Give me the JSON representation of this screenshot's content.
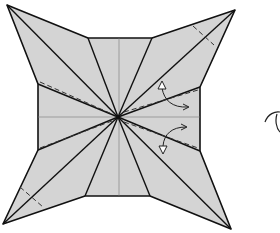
{
  "diagram": {
    "type": "origami-crease-pattern-step",
    "colors": {
      "paper": "#d4d4d4",
      "line": "#111111",
      "background": "#ffffff"
    },
    "center": [
      118,
      117
    ],
    "outline": [
      [
        7,
        5
      ],
      [
        88,
        38
      ],
      [
        152,
        38
      ],
      [
        235,
        10
      ],
      [
        200,
        87
      ],
      [
        200,
        151
      ],
      [
        231,
        229
      ],
      [
        150,
        196
      ],
      [
        85,
        196
      ],
      [
        3,
        224
      ],
      [
        38,
        150
      ],
      [
        38,
        84
      ]
    ],
    "tips": {
      "top_left": [
        7,
        5
      ],
      "top_right": [
        235,
        10
      ],
      "bottom_right": [
        231,
        229
      ],
      "bottom_left": [
        3,
        224
      ]
    },
    "symbols": [
      {
        "name": "valley-fold-arrow-upper",
        "kind": "curved-arrow"
      },
      {
        "name": "valley-fold-arrow-lower",
        "kind": "curved-arrow"
      },
      {
        "name": "partial-next-step-curve",
        "kind": "curve"
      }
    ]
  }
}
